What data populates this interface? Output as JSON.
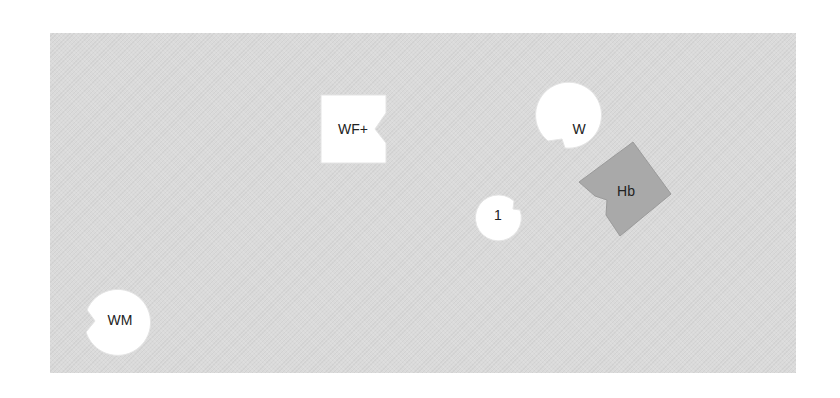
{
  "board": {
    "color": "#dadada"
  },
  "pieces": [
    {
      "id": "wf-plus",
      "label": "WF+",
      "shape": "square-notch-right",
      "fill": "#ffffff"
    },
    {
      "id": "w",
      "label": "W",
      "shape": "circle-notch-lower-left",
      "fill": "#ffffff"
    },
    {
      "id": "hb",
      "label": "Hb",
      "shape": "rotated-square-notch",
      "fill": "#a9a9a9"
    },
    {
      "id": "one",
      "label": "1",
      "shape": "circle-notch-right",
      "fill": "#ffffff"
    },
    {
      "id": "wm",
      "label": "WM",
      "shape": "circle-notch-left",
      "fill": "#ffffff"
    }
  ]
}
